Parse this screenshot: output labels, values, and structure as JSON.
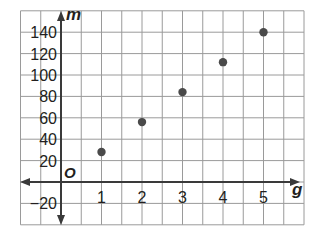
{
  "chart_data": {
    "type": "scatter",
    "title": "",
    "xlabel": "g",
    "ylabel": "m",
    "origin_label": "O",
    "xlim": [
      -1,
      6
    ],
    "ylim": [
      -40,
      160
    ],
    "x_ticks": [
      1,
      2,
      3,
      4,
      5
    ],
    "x_tick_labels": [
      "1",
      "2",
      "3",
      "4",
      "5"
    ],
    "y_ticks": [
      -20,
      20,
      40,
      60,
      80,
      100,
      120,
      140
    ],
    "y_tick_labels": [
      "−20",
      "20",
      "40",
      "60",
      "80",
      "100",
      "120",
      "140"
    ],
    "grid": true,
    "grid_x_step": 0.5,
    "grid_y_step": 20,
    "legend": null,
    "series": [
      {
        "name": "points",
        "x": [
          1,
          2,
          3,
          4,
          5
        ],
        "y": [
          28,
          56,
          84,
          112,
          140
        ]
      }
    ]
  },
  "colors": {
    "grid": "#9a9a9a",
    "axis": "#3a3a3a",
    "point": "#4a4a4a",
    "text": "#231f20"
  }
}
